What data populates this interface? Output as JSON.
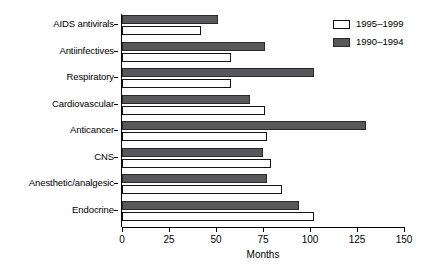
{
  "chart_data": {
    "type": "bar",
    "orientation": "horizontal",
    "title": "",
    "xlabel": "Months",
    "ylabel": "",
    "xlim": [
      0,
      150
    ],
    "xticks": [
      0,
      25,
      50,
      75,
      100,
      125,
      150
    ],
    "grid": false,
    "legend_position": "top-right",
    "categories": [
      "AIDS antivirals",
      "Antiinfectives",
      "Respiratory",
      "Cardiovascular",
      "Anticancer",
      "CNS",
      "Anesthetic/analgesic",
      "Endocrine"
    ],
    "series": [
      {
        "name": "1995–1999",
        "color": "#ffffff",
        "values": [
          42,
          58,
          58,
          76,
          77,
          79,
          85,
          102
        ]
      },
      {
        "name": "1990–1994",
        "color": "#58585a",
        "values": [
          51,
          76,
          102,
          68,
          130,
          75,
          77,
          94
        ]
      }
    ]
  },
  "axis": {
    "x_title": "Months",
    "tick_labels": [
      "0",
      "25",
      "50",
      "75",
      "100",
      "125",
      "150"
    ]
  },
  "legend": {
    "items": [
      {
        "label": "1995–1999",
        "swatch": "open-square-white"
      },
      {
        "label": "1990–1994",
        "swatch": "filled-square-gray"
      }
    ]
  },
  "colors": {
    "series_1990_1994": "#58585a",
    "series_1995_1999": "#ffffff",
    "axis": "#000000",
    "background": "#ffffff"
  }
}
